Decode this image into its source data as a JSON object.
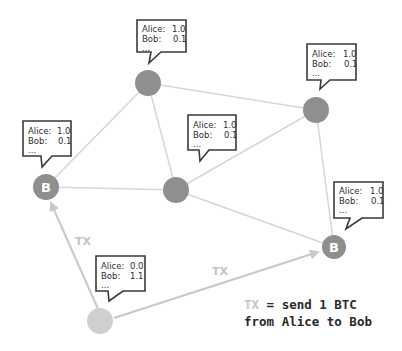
{
  "diagram": {
    "nodes": [
      {
        "id": "top",
        "label": "",
        "balances": {
          "alice": "1.0",
          "bob": "0.1",
          "more": "..."
        }
      },
      {
        "id": "right-top",
        "label": "",
        "balances": {
          "alice": "1.0",
          "bob": "0.1",
          "more": "..."
        }
      },
      {
        "id": "left",
        "label": "B",
        "balances": {
          "alice": "1.0",
          "bob": "0.1",
          "more": "..."
        }
      },
      {
        "id": "middle",
        "label": "",
        "balances": {
          "alice": "1.0",
          "bob": "0.1",
          "more": "..."
        }
      },
      {
        "id": "right-bottom",
        "label": "B",
        "balances": {
          "alice": "1.0",
          "bob": "0.1",
          "more": "..."
        }
      },
      {
        "id": "bottom",
        "label": "",
        "balances": {
          "alice": "0.0",
          "bob": "1.1",
          "more": "..."
        }
      }
    ],
    "labels": {
      "alice": "Alice:",
      "bob": "Bob:"
    },
    "tx_edges": [
      {
        "from": "bottom",
        "to": "left",
        "label": "TX"
      },
      {
        "from": "bottom",
        "to": "right-bottom",
        "label": "TX"
      }
    ],
    "legend": {
      "tx": "TX",
      "line1_rest": " = send 1 BTC",
      "line2": "from Alice to Bob"
    },
    "colors": {
      "node": "#8f8f8f",
      "node_light": "#cfcfcf",
      "edge": "#d6d6d6",
      "tx": "#c4c4c4",
      "callout_border": "#3a3a3a"
    }
  }
}
